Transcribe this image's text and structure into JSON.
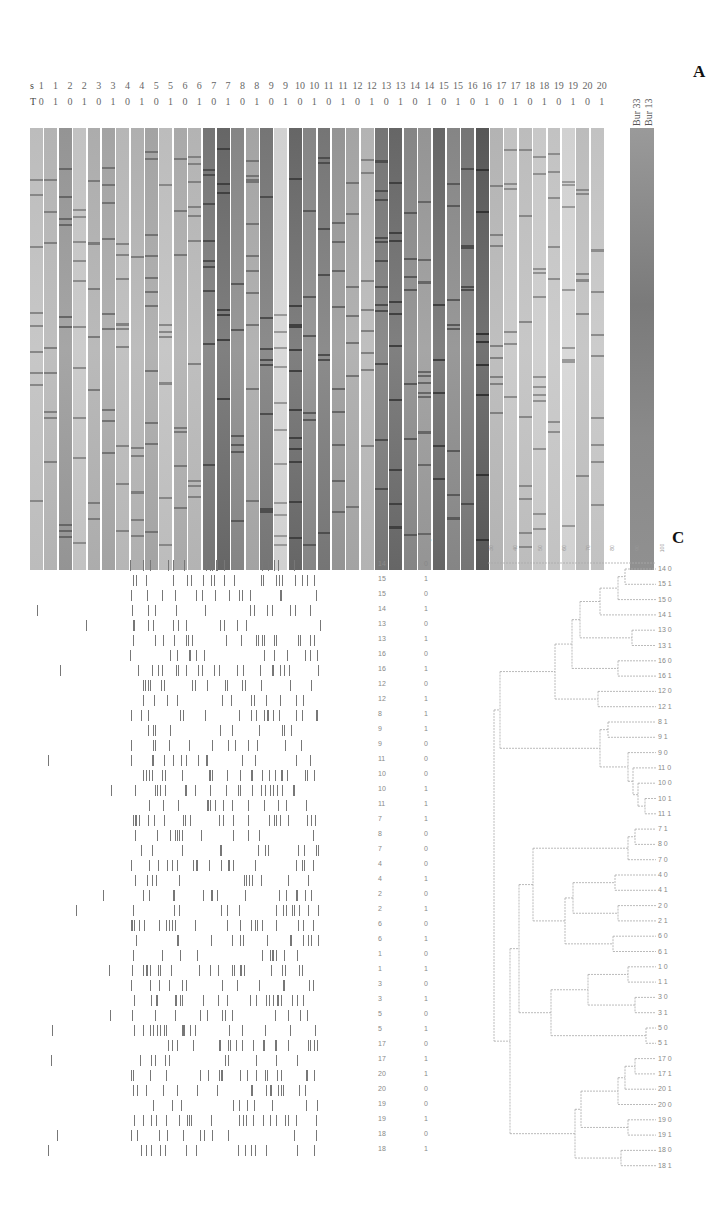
{
  "figure": {
    "panels": [
      "A",
      "B",
      "C"
    ],
    "panelA": {
      "letter": "A",
      "row_s_label": "s",
      "row_T_label": "T",
      "s_values": [
        "1",
        "1",
        "2",
        "2",
        "3",
        "3",
        "4",
        "4",
        "5",
        "5",
        "6",
        "6",
        "7",
        "7",
        "8",
        "8",
        "9",
        "9",
        "10",
        "10",
        "11",
        "11",
        "12",
        "12",
        "13",
        "13",
        "14",
        "14",
        "15",
        "15",
        "16",
        "16",
        "17",
        "17",
        "18",
        "18",
        "19",
        "19",
        "20",
        "20"
      ],
      "T_values": [
        "0",
        "1",
        "0",
        "1",
        "0",
        "1",
        "0",
        "1",
        "0",
        "1",
        "0",
        "1",
        "0",
        "1",
        "0",
        "1",
        "0",
        "1",
        "0",
        "1",
        "0",
        "1",
        "0",
        "1",
        "0",
        "1",
        "0",
        "1",
        "0",
        "1",
        "0",
        "1",
        "0",
        "1",
        "0",
        "1",
        "0",
        "1",
        "0",
        "1"
      ],
      "marker_labels": [
        "Bur 33",
        "Bur 13"
      ],
      "lane_shades": [
        0.22,
        0.25,
        0.35,
        0.2,
        0.27,
        0.3,
        0.24,
        0.26,
        0.3,
        0.22,
        0.28,
        0.25,
        0.45,
        0.5,
        0.4,
        0.3,
        0.45,
        0.15,
        0.5,
        0.4,
        0.45,
        0.35,
        0.3,
        0.25,
        0.45,
        0.5,
        0.4,
        0.35,
        0.5,
        0.4,
        0.45,
        0.55,
        0.25,
        0.2,
        0.22,
        0.18,
        0.2,
        0.15,
        0.22,
        0.2
      ]
    },
    "panelB": {
      "letter": "B",
      "rows": [
        {
          "s": "14",
          "T": "0"
        },
        {
          "s": "15",
          "T": "1"
        },
        {
          "s": "15",
          "T": "0"
        },
        {
          "s": "14",
          "T": "1"
        },
        {
          "s": "13",
          "T": "0"
        },
        {
          "s": "13",
          "T": "1"
        },
        {
          "s": "16",
          "T": "0"
        },
        {
          "s": "16",
          "T": "1"
        },
        {
          "s": "12",
          "T": "0"
        },
        {
          "s": "12",
          "T": "1"
        },
        {
          "s": "8",
          "T": "1"
        },
        {
          "s": "9",
          "T": "1"
        },
        {
          "s": "9",
          "T": "0"
        },
        {
          "s": "11",
          "T": "0"
        },
        {
          "s": "10",
          "T": "0"
        },
        {
          "s": "10",
          "T": "1"
        },
        {
          "s": "11",
          "T": "1"
        },
        {
          "s": "7",
          "T": "1"
        },
        {
          "s": "8",
          "T": "0"
        },
        {
          "s": "7",
          "T": "0"
        },
        {
          "s": "4",
          "T": "0"
        },
        {
          "s": "4",
          "T": "1"
        },
        {
          "s": "2",
          "T": "0"
        },
        {
          "s": "2",
          "T": "1"
        },
        {
          "s": "6",
          "T": "0"
        },
        {
          "s": "6",
          "T": "1"
        },
        {
          "s": "1",
          "T": "0"
        },
        {
          "s": "1",
          "T": "1"
        },
        {
          "s": "3",
          "T": "0"
        },
        {
          "s": "3",
          "T": "1"
        },
        {
          "s": "5",
          "T": "0"
        },
        {
          "s": "5",
          "T": "1"
        },
        {
          "s": "17",
          "T": "0"
        },
        {
          "s": "17",
          "T": "1"
        },
        {
          "s": "20",
          "T": "1"
        },
        {
          "s": "20",
          "T": "0"
        },
        {
          "s": "19",
          "T": "0"
        },
        {
          "s": "19",
          "T": "1"
        },
        {
          "s": "18",
          "T": "0"
        },
        {
          "s": "18",
          "T": "1"
        }
      ]
    },
    "panelC": {
      "letter": "C",
      "scale_ticks": [
        "30",
        "40",
        "50",
        "60",
        "70",
        "80",
        "90",
        "100"
      ],
      "leaf_order": [
        "14 0",
        "15 1",
        "15 0",
        "14 1",
        "13 0",
        "13 1",
        "16 0",
        "16 1",
        "12 0",
        "12 1",
        "8 1",
        "9 1",
        "9 0",
        "11 0",
        "10 0",
        "10 1",
        "11 1",
        "7 1",
        "8 0",
        "7 0",
        "4 0",
        "4 1",
        "2 0",
        "2 1",
        "6 0",
        "6 1",
        "1 0",
        "1 1",
        "3 0",
        "3 1",
        "5 0",
        "5 1",
        "17 0",
        "17 1",
        "20 1",
        "20 0",
        "19 0",
        "19 1",
        "18 0",
        "18 1"
      ],
      "clusters": [
        {
          "name": "cluster-12-16",
          "members": [
            "14 0",
            "15 1",
            "15 0",
            "14 1",
            "13 0",
            "13 1",
            "16 0",
            "16 1",
            "12 0",
            "12 1"
          ]
        },
        {
          "name": "cluster-8-11",
          "members": [
            "8 1",
            "9 1",
            "9 0",
            "11 0",
            "10 0",
            "10 1",
            "11 1"
          ]
        },
        {
          "name": "cluster-1-7",
          "members": [
            "7 1",
            "8 0",
            "7 0",
            "4 0",
            "4 1",
            "2 0",
            "2 1",
            "6 0",
            "6 1",
            "1 0",
            "1 1",
            "3 0",
            "3 1",
            "5 0",
            "5 1"
          ]
        },
        {
          "name": "cluster-17-20",
          "members": [
            "17 0",
            "17 1",
            "20 1",
            "20 0",
            "19 0",
            "19 1",
            "18 0",
            "18 1"
          ]
        }
      ]
    }
  }
}
